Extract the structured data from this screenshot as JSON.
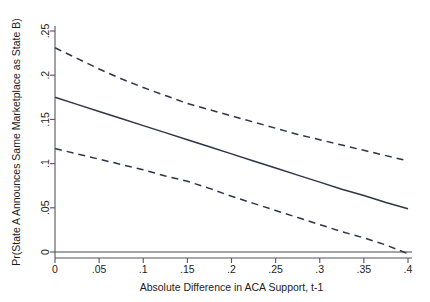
{
  "chart_data": {
    "type": "line",
    "title": "",
    "subtitle": "",
    "xlabel": "Absolute Difference in ACA Support, t-1",
    "ylabel": "Pr(State A Announces Same Marketplace as State B)",
    "xlim": [
      0,
      0.4
    ],
    "ylim": [
      0,
      0.25
    ],
    "grid": false,
    "legend": "none",
    "xticks": [
      0,
      0.05,
      0.1,
      0.15,
      0.2,
      0.25,
      0.3,
      0.35,
      0.4
    ],
    "xticklabels": [
      "0",
      ".05",
      ".1",
      ".15",
      ".2",
      ".25",
      ".3",
      ".35",
      ".4"
    ],
    "yticks": [
      0,
      0.05,
      0.1,
      0.15,
      0.2,
      0.25
    ],
    "yticklabels": [
      "0",
      ".05",
      ".1",
      ".15",
      ".2",
      ".25"
    ],
    "x": [
      0,
      0.025,
      0.05,
      0.075,
      0.1,
      0.125,
      0.15,
      0.175,
      0.2,
      0.225,
      0.25,
      0.275,
      0.3,
      0.325,
      0.35,
      0.375,
      0.4
    ],
    "series": [
      {
        "name": "Upper 95% CI",
        "style": "dashed",
        "color": "#2f3548",
        "values": [
          0.231,
          0.219,
          0.207,
          0.196,
          0.186,
          0.177,
          0.168,
          0.161,
          0.154,
          0.147,
          0.14,
          0.133,
          0.127,
          0.121,
          0.115,
          0.109,
          0.103
        ]
      },
      {
        "name": "Predicted probability",
        "style": "solid",
        "color": "#2f3548",
        "values": [
          0.175,
          0.167,
          0.159,
          0.151,
          0.143,
          0.135,
          0.127,
          0.119,
          0.111,
          0.103,
          0.095,
          0.087,
          0.079,
          0.071,
          0.064,
          0.056,
          0.049
        ]
      },
      {
        "name": "Lower 95% CI",
        "style": "dashed",
        "color": "#2f3548",
        "values": [
          0.117,
          0.111,
          0.105,
          0.099,
          0.093,
          0.086,
          0.08,
          0.072,
          0.063,
          0.055,
          0.047,
          0.039,
          0.031,
          0.023,
          0.016,
          0.008,
          -0.002
        ]
      }
    ],
    "reference_line": {
      "y": 0,
      "style": "solid",
      "color": "#4a4a55"
    }
  }
}
